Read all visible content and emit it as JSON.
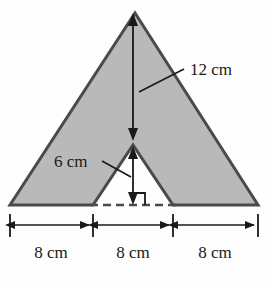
{
  "figure": {
    "type": "geometry-diagram",
    "colors": {
      "background": "#fefefe",
      "shape_fill": "#b9b9b9",
      "shape_stroke": "#4a4a4a",
      "annotation": "#1a1a1a",
      "dashed_line": "#4a4a4a"
    },
    "shape": {
      "name": "outer-triangle",
      "apex": {
        "x": 135,
        "y": 13
      },
      "base_left": {
        "x": 10,
        "y": 205
      },
      "base_right": {
        "x": 258,
        "y": 205
      },
      "notch": {
        "name": "inner-triangle-notch",
        "apex": {
          "x": 133,
          "y": 145
        },
        "base_left": {
          "x": 93,
          "y": 205
        },
        "base_right": {
          "x": 173,
          "y": 205
        }
      }
    },
    "annotations": {
      "height_outer": {
        "label": "12 cm",
        "value": 12,
        "unit": "cm",
        "measures": "vertical distance from outer apex to notch apex",
        "arrow": {
          "x": 133,
          "y_top": 15,
          "y_bottom": 139
        },
        "leader_from": {
          "x": 184,
          "y": 70
        },
        "leader_to": {
          "x": 139,
          "y": 91
        },
        "text_pos": {
          "x": 190,
          "y": 70
        }
      },
      "height_inner": {
        "label": "6 cm",
        "value": 6,
        "unit": "cm",
        "measures": "vertical distance from notch apex to base",
        "arrow": {
          "x": 133,
          "y_top": 149,
          "y_bottom": 203
        },
        "leader_from": {
          "x": 101,
          "y": 161
        },
        "leader_to": {
          "x": 131,
          "y": 176
        },
        "text_pos": {
          "x": 56,
          "y": 166
        }
      },
      "right_angle": {
        "label": "right-angle-marker",
        "corner": {
          "x": 133,
          "y": 204
        },
        "size": 11
      },
      "base_segments": [
        {
          "label": "8 cm",
          "value": 8,
          "unit": "cm",
          "x_start": 10,
          "x_end": 93,
          "text_x": 51
        },
        {
          "label": "8 cm",
          "value": 8,
          "unit": "cm",
          "x_start": 93,
          "x_end": 173,
          "text_x": 133
        },
        {
          "label": "8 cm",
          "value": 8,
          "unit": "cm",
          "x_start": 173,
          "x_end": 258,
          "text_x": 215
        }
      ],
      "dimension_line_y": 225,
      "dimension_text_y": 252,
      "dashed_base_y": 205
    }
  }
}
